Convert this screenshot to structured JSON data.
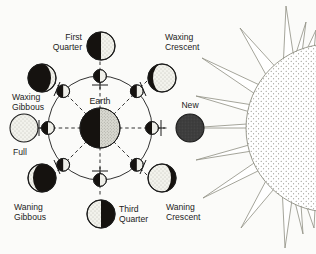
{
  "diagram": {
    "center_body": {
      "name": "Earth",
      "label": "Earth"
    },
    "light_source": {
      "name": "Sun",
      "label": "",
      "rays": 13
    },
    "colors": {
      "dark": "#15120f",
      "light": "#efefe9",
      "stroke": "#1b1b1b",
      "background": "#fbfbf9",
      "new_moon_fill": "#3a3a3a",
      "sun_outline": "#8a8a7e",
      "sun_fill": "#ffffff"
    },
    "orbit": {
      "radius": 52,
      "center_x": 100,
      "center_y": 128,
      "dashed_rays": 8
    },
    "phases": [
      {
        "id": "first-quarter",
        "label": "First\nQuarter",
        "line1": "First",
        "line2": "Quarter",
        "angle_deg": 90,
        "lit_fraction": 0.5,
        "lit_side": "right",
        "shape": "half-right-light"
      },
      {
        "id": "waxing-crescent",
        "label": "Waxing\nCrescent",
        "line1": "Waxing",
        "line2": "Crescent",
        "angle_deg": 45,
        "lit_fraction": 0.18,
        "lit_side": "right",
        "shape": "crescent-right-light"
      },
      {
        "id": "new",
        "label": "New",
        "line1": "New",
        "line2": "",
        "angle_deg": 0,
        "lit_fraction": 0.0,
        "lit_side": "none",
        "shape": "full-dark"
      },
      {
        "id": "waning-crescent",
        "label": "Waning\nCrescent",
        "line1": "Waning",
        "line2": "Crescent",
        "angle_deg": -45,
        "lit_fraction": 0.18,
        "lit_side": "left",
        "shape": "crescent-left-light"
      },
      {
        "id": "third-quarter",
        "label": "Third\nQuarter",
        "line1": "Third",
        "line2": "Quarter",
        "angle_deg": -90,
        "lit_fraction": 0.5,
        "lit_side": "left",
        "shape": "half-left-light"
      },
      {
        "id": "waning-gibbous",
        "label": "Waning\nGibbous",
        "line1": "Waning",
        "line2": "Gibbous",
        "angle_deg": -135,
        "lit_fraction": 0.82,
        "lit_side": "left",
        "shape": "gibbous-left-light"
      },
      {
        "id": "full",
        "label": "Full",
        "line1": "Full",
        "line2": "",
        "angle_deg": 180,
        "lit_fraction": 1.0,
        "lit_side": "all",
        "shape": "full-light"
      },
      {
        "id": "waxing-gibbous",
        "label": "Waxing\nGibbous",
        "line1": "Waxing",
        "line2": "Gibbous",
        "angle_deg": 135,
        "lit_fraction": 0.82,
        "lit_side": "right",
        "shape": "gibbous-right-light"
      }
    ],
    "orbit_moons_count": 8,
    "orbit_moon_note": "half dark toward away-from-sun side, half light toward sun"
  }
}
